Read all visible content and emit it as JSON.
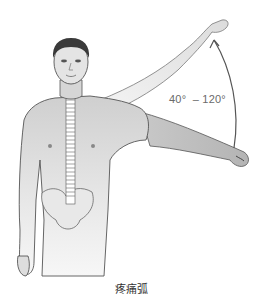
{
  "figure": {
    "angle_label": "40°  – 120°",
    "caption": "疼痛弧",
    "colors": {
      "skin_light": "#f2f2f2",
      "skin_mid": "#d9d9d9",
      "skin_dark": "#b8b8b8",
      "outline": "#555555",
      "hair": "#3a3a3a",
      "arc": "#555555"
    }
  }
}
